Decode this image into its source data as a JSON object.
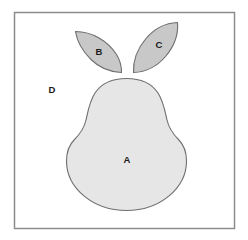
{
  "figure": {
    "frame": {
      "name": "diagram-frame",
      "border_color": "#8c8c8c",
      "background_color": "#ffffff",
      "x": 14,
      "y": 12,
      "width": 220,
      "height": 216
    },
    "colors": {
      "body_fill": "#e6e6e6",
      "leaf_fill": "#c8c8c8",
      "outline": "#6e6e6e",
      "label_text": "#1a1a1a",
      "frame_border": "#8c8c8c",
      "background": "#ffffff"
    },
    "regions": [
      {
        "id": "A",
        "label": "A",
        "name": "region-a-pear-body",
        "shape": "pear-body",
        "fill": "#e6e6e6",
        "label_x": 127,
        "label_y": 160
      },
      {
        "id": "B",
        "label": "B",
        "name": "region-b-left-leaf",
        "shape": "left-leaf",
        "fill": "#c8c8c8",
        "label_x": 99,
        "label_y": 52
      },
      {
        "id": "C",
        "label": "C",
        "name": "region-c-right-leaf",
        "shape": "right-leaf",
        "fill": "#c8c8c8",
        "label_x": 159,
        "label_y": 45
      },
      {
        "id": "D",
        "label": "D",
        "name": "region-d-background",
        "shape": "background",
        "fill": "#ffffff",
        "label_x": 52,
        "label_y": 90
      }
    ],
    "paths": {
      "pear_body": "M 126.5 78.5 C 112 78.5 101 84 95 93 C 89.5 101.5 88 111 86 120 C 84 129 80 134 74.5 139.5 C 69 145 66.5 152 66.5 161 C 66.5 188 93 210.5 126.5 210.5 C 160 210.5 186.5 188 186.5 161 C 186.5 152 184 145 178.5 139.5 C 173 134 169 129 167 120 C 165 111 163.5 101.5 158 93 C 152 84 141 78.5 126.5 78.5 Z",
      "left_leaf": "M 75.5 31.5 C 92 31.5 108 41 116.5 54.5 C 120 60 121.5 66 121.5 72.5 C 110 72 99 67.5 91 59.5 C 82 50.5 77 41.5 75.5 31.5 Z",
      "right_leaf": "M 177.5 22.5 C 178.5 34 174 46.5 165.5 56.5 C 157 66.5 145.5 72 133.5 72.5 C 133 61 137.5 48.5 146 38.5 C 154.5 28.5 166 23 177.5 22.5 Z"
    }
  }
}
